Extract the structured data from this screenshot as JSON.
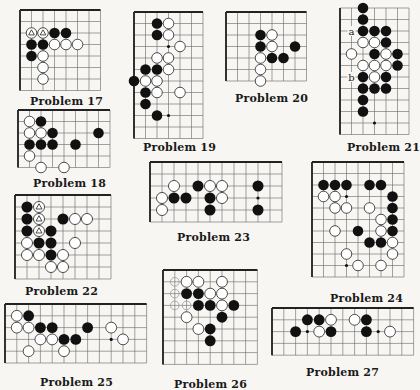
{
  "page": {
    "background": "#f7f6f2",
    "line_color": "#333333",
    "black_stone": "#111111",
    "white_stone": "#ffffff"
  },
  "problems": [
    {
      "id": 17,
      "label": "Problem 17",
      "x": 20,
      "y": 10,
      "cols": 7,
      "rows": 7,
      "step": 11.5,
      "edges": [
        "top",
        "left"
      ],
      "black": [
        [
          3,
          2
        ],
        [
          4,
          2
        ],
        [
          1,
          3
        ],
        [
          2,
          3
        ],
        [
          1,
          4
        ]
      ],
      "white": [
        [
          3,
          3
        ],
        [
          4,
          3
        ],
        [
          5,
          3
        ],
        [
          2,
          4
        ],
        [
          2,
          5
        ],
        [
          2,
          6
        ]
      ],
      "triangle_white": [
        [
          1,
          2
        ],
        [
          2,
          2
        ]
      ],
      "hoshi": [],
      "letters": [],
      "caption": {
        "x": 30,
        "y": 95
      }
    },
    {
      "id": 19,
      "label": "Problem 19",
      "x": 134,
      "y": 12,
      "cols": 6,
      "rows": 11,
      "step": 11.5,
      "edges": [
        "top",
        "left"
      ],
      "black": [
        [
          2,
          1
        ],
        [
          2,
          2
        ],
        [
          1,
          5
        ],
        [
          2,
          5
        ],
        [
          0,
          6
        ],
        [
          1,
          7
        ],
        [
          1,
          8
        ],
        [
          2,
          9
        ]
      ],
      "white": [
        [
          3,
          1
        ],
        [
          3,
          2
        ],
        [
          4,
          3
        ],
        [
          2,
          4
        ],
        [
          3,
          4
        ],
        [
          3,
          5
        ],
        [
          1,
          6
        ],
        [
          2,
          6
        ],
        [
          2,
          7
        ],
        [
          4,
          7
        ]
      ],
      "triangle_white": [],
      "hoshi": [
        [
          3,
          3
        ],
        [
          3,
          9
        ]
      ],
      "letters": [],
      "caption": {
        "x": 143,
        "y": 141
      }
    },
    {
      "id": 20,
      "label": "Problem 20",
      "x": 226,
      "y": 12,
      "cols": 7,
      "rows": 6,
      "step": 11.5,
      "edges": [
        "top",
        "left"
      ],
      "black": [
        [
          3,
          2
        ],
        [
          3,
          3
        ],
        [
          6,
          3
        ],
        [
          4,
          4
        ],
        [
          5,
          4
        ]
      ],
      "white": [
        [
          4,
          2
        ],
        [
          4,
          3
        ],
        [
          3,
          4
        ],
        [
          3,
          5
        ],
        [
          3,
          6
        ]
      ],
      "triangle_white": [],
      "hoshi": [],
      "letters": [],
      "caption": {
        "x": 235,
        "y": 92
      }
    },
    {
      "id": 21,
      "label": "Problem 21",
      "x": 340,
      "y": 8,
      "cols": 6,
      "rows": 11,
      "step": 11.5,
      "edges": [
        "left"
      ],
      "black": [
        [
          2,
          0
        ],
        [
          2,
          1
        ],
        [
          2,
          2
        ],
        [
          3,
          2
        ],
        [
          4,
          2
        ],
        [
          4,
          3
        ],
        [
          3,
          4
        ],
        [
          5,
          4
        ],
        [
          5,
          5
        ],
        [
          2,
          6
        ],
        [
          4,
          6
        ],
        [
          2,
          7
        ],
        [
          3,
          7
        ],
        [
          4,
          7
        ],
        [
          2,
          8
        ],
        [
          2,
          9
        ]
      ],
      "white": [
        [
          2,
          3
        ],
        [
          3,
          3
        ],
        [
          1,
          4
        ],
        [
          4,
          4
        ],
        [
          2,
          5
        ],
        [
          3,
          5
        ],
        [
          4,
          5
        ],
        [
          3,
          6
        ]
      ],
      "triangle_white": [],
      "hoshi": [
        [
          3,
          10
        ]
      ],
      "letters": [
        {
          "text": "a",
          "col": 1,
          "row": 2
        },
        {
          "text": "b",
          "col": 1,
          "row": 6
        }
      ],
      "caption": {
        "x": 347,
        "y": 141
      }
    },
    {
      "id": 18,
      "label": "Problem 18",
      "x": 18,
      "y": 110,
      "cols": 8,
      "rows": 5,
      "step": 11.5,
      "edges": [
        "top",
        "left"
      ],
      "black": [
        [
          2,
          1
        ],
        [
          3,
          2
        ],
        [
          7,
          2
        ],
        [
          1,
          3
        ],
        [
          2,
          3
        ],
        [
          3,
          3
        ],
        [
          5,
          3
        ]
      ],
      "white": [
        [
          1,
          1
        ],
        [
          1,
          2
        ],
        [
          2,
          2
        ],
        [
          1,
          4
        ],
        [
          2,
          5
        ],
        [
          4,
          5
        ]
      ],
      "triangle_white": [],
      "hoshi": [],
      "letters": [],
      "caption": {
        "x": 33,
        "y": 177
      }
    },
    {
      "id": 23,
      "label": "Problem 23",
      "x": 150,
      "y": 162,
      "cols": 11,
      "rows": 5,
      "step": 12,
      "edges": [
        "top",
        "left"
      ],
      "black": [
        [
          4,
          2
        ],
        [
          9,
          2
        ],
        [
          2,
          3
        ],
        [
          3,
          3
        ],
        [
          5,
          3
        ],
        [
          5,
          4
        ],
        [
          9,
          4
        ]
      ],
      "white": [
        [
          2,
          2
        ],
        [
          5,
          2
        ],
        [
          6,
          2
        ],
        [
          1,
          3
        ],
        [
          6,
          3
        ],
        [
          1,
          4
        ]
      ],
      "triangle_white": [],
      "hoshi": [
        [
          9,
          3
        ]
      ],
      "letters": [],
      "caption": {
        "x": 177,
        "y": 231
      }
    },
    {
      "id": 22,
      "label": "Problem 22",
      "x": 15,
      "y": 195,
      "cols": 8,
      "rows": 7,
      "step": 12,
      "edges": [
        "top",
        "left"
      ],
      "black": [
        [
          1,
          1
        ],
        [
          1,
          2
        ],
        [
          4,
          2
        ],
        [
          1,
          3
        ],
        [
          3,
          3
        ],
        [
          2,
          4
        ],
        [
          3,
          4
        ],
        [
          3,
          5
        ]
      ],
      "white": [
        [
          5,
          2
        ],
        [
          6,
          2
        ],
        [
          1,
          4
        ],
        [
          5,
          4
        ],
        [
          1,
          5
        ],
        [
          2,
          5
        ],
        [
          4,
          5
        ],
        [
          3,
          6
        ],
        [
          4,
          6
        ]
      ],
      "triangle_white": [
        [
          2,
          1
        ],
        [
          2,
          2
        ],
        [
          2,
          3
        ]
      ],
      "hoshi": [],
      "letters": [],
      "caption": {
        "x": 25,
        "y": 285
      }
    },
    {
      "id": 24,
      "label": "Problem 24",
      "x": 312,
      "y": 162,
      "cols": 8,
      "rows": 10,
      "step": 11.5,
      "edges": [
        "top",
        "left"
      ],
      "black": [
        [
          1,
          2
        ],
        [
          2,
          2
        ],
        [
          3,
          2
        ],
        [
          5,
          2
        ],
        [
          6,
          2
        ],
        [
          7,
          3
        ],
        [
          7,
          4
        ],
        [
          7,
          5
        ],
        [
          4,
          6
        ],
        [
          7,
          6
        ],
        [
          5,
          7
        ],
        [
          6,
          7
        ]
      ],
      "white": [
        [
          1,
          3
        ],
        [
          2,
          3
        ],
        [
          2,
          4
        ],
        [
          3,
          4
        ],
        [
          5,
          4
        ],
        [
          6,
          5
        ],
        [
          2,
          6
        ],
        [
          6,
          6
        ],
        [
          7,
          7
        ],
        [
          3,
          8
        ],
        [
          7,
          8
        ],
        [
          4,
          9
        ],
        [
          6,
          9
        ]
      ],
      "triangle_white": [],
      "hoshi": [
        [
          3,
          3
        ],
        [
          3,
          9
        ]
      ],
      "letters": [],
      "caption": {
        "x": 330,
        "y": 292
      }
    },
    {
      "id": 25,
      "label": "Problem 25",
      "x": 5,
      "y": 304,
      "cols": 12,
      "rows": 5,
      "step": 11.8,
      "edges": [
        "top",
        "left"
      ],
      "black": [
        [
          2,
          1
        ],
        [
          3,
          2
        ],
        [
          4,
          2
        ],
        [
          7,
          2
        ],
        [
          5,
          3
        ],
        [
          6,
          3
        ]
      ],
      "white": [
        [
          1,
          1
        ],
        [
          1,
          2
        ],
        [
          2,
          2
        ],
        [
          9,
          2
        ],
        [
          3,
          3
        ],
        [
          4,
          3
        ],
        [
          10,
          3
        ],
        [
          2,
          4
        ],
        [
          5,
          4
        ]
      ],
      "triangle_white": [],
      "hoshi": [
        [
          9,
          3
        ]
      ],
      "letters": [],
      "caption": {
        "x": 40,
        "y": 376
      }
    },
    {
      "id": 26,
      "label": "Problem 26",
      "x": 163,
      "y": 270,
      "cols": 8,
      "rows": 8,
      "step": 11.8,
      "edges": [
        "top",
        "left"
      ],
      "black": [
        [
          2,
          2
        ],
        [
          3,
          2
        ],
        [
          3,
          3
        ],
        [
          4,
          3
        ],
        [
          6,
          3
        ],
        [
          5,
          4
        ],
        [
          4,
          5
        ],
        [
          4,
          6
        ]
      ],
      "white": [
        [
          2,
          1
        ],
        [
          3,
          1
        ],
        [
          5,
          1
        ],
        [
          4,
          2
        ],
        [
          5,
          2
        ],
        [
          5,
          3
        ],
        [
          2,
          4
        ],
        [
          3,
          5
        ]
      ],
      "faint_marks": [
        [
          1,
          1
        ],
        [
          1,
          2
        ],
        [
          1,
          3
        ],
        [
          2,
          3
        ]
      ],
      "triangle_white": [],
      "hoshi": [],
      "letters": [],
      "caption": {
        "x": 174,
        "y": 378
      }
    },
    {
      "id": 27,
      "label": "Problem 27",
      "x": 272,
      "y": 308,
      "cols": 12,
      "rows": 4,
      "step": 11.8,
      "edges": [
        "top",
        "left"
      ],
      "black": [
        [
          3,
          1
        ],
        [
          4,
          1
        ],
        [
          8,
          1
        ],
        [
          2,
          2
        ],
        [
          5,
          2
        ],
        [
          8,
          2
        ]
      ],
      "white": [
        [
          5,
          1
        ],
        [
          7,
          1
        ],
        [
          4,
          2
        ],
        [
          10,
          2
        ]
      ],
      "triangle_white": [],
      "hoshi": [
        [
          3,
          2
        ],
        [
          9,
          2
        ]
      ],
      "letters": [],
      "caption": {
        "x": 306,
        "y": 366
      }
    }
  ]
}
